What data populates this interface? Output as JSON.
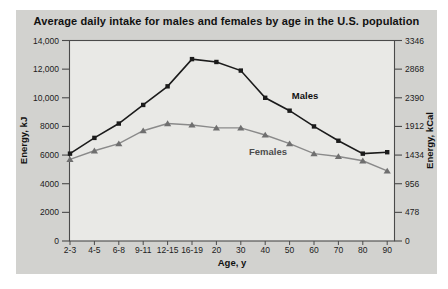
{
  "chart": {
    "title": "Average daily intake for males and females by age in the U.S. population"
  },
  "chart_data": {
    "type": "line",
    "categories": [
      "2-3",
      "4-5",
      "6-8",
      "9-11",
      "12-15",
      "16-19",
      "20",
      "30",
      "40",
      "50",
      "60",
      "70",
      "80",
      "90"
    ],
    "series": [
      {
        "name": "Males",
        "marker": "square",
        "values": [
          6100,
          7200,
          8200,
          9500,
          10800,
          12700,
          12500,
          11900,
          10000,
          9100,
          8000,
          7000,
          6100,
          6200
        ],
        "label_anchor": {
          "x": 305,
          "y": 99
        }
      },
      {
        "name": "Females",
        "marker": "triangle",
        "values": [
          5700,
          6300,
          6800,
          7700,
          8200,
          8100,
          7900,
          7900,
          7400,
          6800,
          6100,
          5900,
          5600,
          4900
        ],
        "label_anchor": {
          "x": 268,
          "y": 155
        }
      }
    ],
    "xlabel": "Age, y",
    "ylabel_left": "Energy, kJ",
    "ylabel_right": "Energy, kCal",
    "y_left_values": [
      0,
      2000,
      4000,
      6000,
      8000,
      10000,
      12000,
      14000
    ],
    "y_left_ticks": [
      "0",
      "2000",
      "4000",
      "6000",
      "8000",
      "10,000",
      "12,000",
      "14,000"
    ],
    "y_right_ticks": [
      "0",
      "478",
      "956",
      "1434",
      "1912",
      "2390",
      "2868",
      "3346"
    ],
    "ylim": [
      0,
      14000
    ],
    "grid": false,
    "legend": "inline-labels"
  },
  "colors": {
    "panel_bg": "#d2d2cf",
    "plot_bg": "#e9e9e6",
    "axis": "#4a4a4a",
    "tick_text": "#1c1c1c",
    "males_line": "#1b1b1b",
    "males_marker": "#1b1b1b",
    "females_line": "#8a8a8a",
    "females_marker": "#6f6f6f",
    "males_label": "#111111",
    "females_label": "#4d4d4d"
  }
}
